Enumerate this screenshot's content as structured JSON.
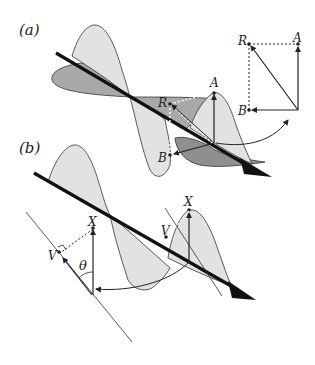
{
  "figure": {
    "type": "diagram",
    "panels": [
      {
        "id": "a",
        "label": "(a)",
        "vector_labels": {
          "resultant": "R",
          "component_vertical": "A",
          "component_horizontal": "B"
        },
        "inset": {
          "labels": [
            "R",
            "A",
            "B"
          ]
        }
      },
      {
        "id": "b",
        "label": "(b)",
        "vector_labels": {
          "field": "X",
          "projection": "V",
          "angle": "θ"
        }
      }
    ],
    "colors": {
      "light_fill": "#e2e2e2",
      "dark_fill": "#a9a9a9",
      "stroke": "#222222",
      "axis": "#111111"
    }
  }
}
